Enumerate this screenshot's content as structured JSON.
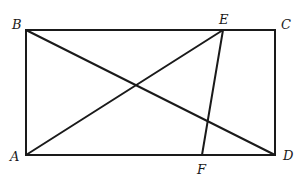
{
  "diagram": {
    "type": "geometry",
    "stroke_color": "#1a1a1a",
    "points": {
      "A": {
        "label": "A",
        "x": 26,
        "y": 155
      },
      "B": {
        "label": "B",
        "x": 26,
        "y": 30
      },
      "C": {
        "label": "C",
        "x": 275,
        "y": 30
      },
      "D": {
        "label": "D",
        "x": 275,
        "y": 155
      },
      "E": {
        "label": "E",
        "x": 223,
        "y": 30
      },
      "F": {
        "label": "F",
        "x": 202,
        "y": 155
      }
    },
    "segments": [
      {
        "from": "A",
        "to": "B"
      },
      {
        "from": "B",
        "to": "C"
      },
      {
        "from": "C",
        "to": "D"
      },
      {
        "from": "D",
        "to": "A"
      },
      {
        "from": "B",
        "to": "D"
      },
      {
        "from": "A",
        "to": "E"
      },
      {
        "from": "E",
        "to": "F"
      }
    ],
    "labels": {
      "A": "A",
      "B": "B",
      "C": "C",
      "D": "D",
      "E": "E",
      "F": "F"
    }
  }
}
